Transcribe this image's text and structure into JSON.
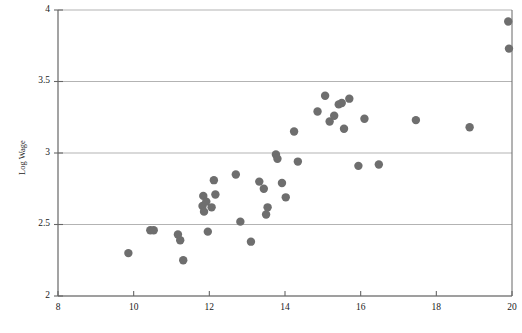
{
  "chart_data": {
    "type": "scatter",
    "title": "",
    "subtitle": "",
    "xlabel": "",
    "ylabel": "Log Wage",
    "xlim": [
      8,
      20
    ],
    "ylim": [
      2,
      4
    ],
    "xticks": [
      8,
      10,
      12,
      14,
      16,
      18,
      20
    ],
    "xticklabels": [
      "8",
      "10",
      "12",
      "14",
      "16",
      "18",
      "20"
    ],
    "yticks": [
      2,
      2.5,
      3,
      3.5,
      4
    ],
    "yticklabels": [
      "2",
      "2.5",
      "3",
      "3.5",
      "4"
    ],
    "grid": {
      "horizontal": true,
      "vertical": false,
      "color": "#b3b3b3"
    },
    "legend": {
      "visible": false,
      "position": "none"
    },
    "marker": {
      "shape": "circle",
      "color": "#6e6e6e",
      "size": 5.2
    },
    "axis_color": "#666666",
    "series": [
      {
        "name": "observations",
        "points": [
          [
            9.86,
            2.3
          ],
          [
            10.44,
            2.46
          ],
          [
            10.53,
            2.46
          ],
          [
            11.17,
            2.43
          ],
          [
            11.23,
            2.39
          ],
          [
            11.31,
            2.25
          ],
          [
            11.82,
            2.63
          ],
          [
            11.84,
            2.7
          ],
          [
            11.86,
            2.59
          ],
          [
            11.92,
            2.66
          ],
          [
            11.96,
            2.45
          ],
          [
            12.06,
            2.62
          ],
          [
            12.12,
            2.81
          ],
          [
            12.16,
            2.71
          ],
          [
            12.7,
            2.85
          ],
          [
            12.82,
            2.52
          ],
          [
            13.1,
            2.38
          ],
          [
            13.32,
            2.8
          ],
          [
            13.44,
            2.75
          ],
          [
            13.5,
            2.57
          ],
          [
            13.54,
            2.62
          ],
          [
            13.76,
            2.99
          ],
          [
            13.8,
            2.96
          ],
          [
            13.92,
            2.79
          ],
          [
            14.02,
            2.69
          ],
          [
            14.24,
            3.15
          ],
          [
            14.34,
            2.94
          ],
          [
            14.86,
            3.29
          ],
          [
            15.06,
            3.4
          ],
          [
            15.18,
            3.22
          ],
          [
            15.3,
            3.26
          ],
          [
            15.42,
            3.34
          ],
          [
            15.5,
            3.35
          ],
          [
            15.56,
            3.17
          ],
          [
            15.7,
            3.38
          ],
          [
            15.94,
            2.91
          ],
          [
            16.1,
            3.24
          ],
          [
            16.48,
            2.92
          ],
          [
            17.46,
            3.23
          ],
          [
            18.88,
            3.18
          ],
          [
            19.9,
            3.92
          ],
          [
            19.92,
            3.73
          ]
        ]
      }
    ]
  },
  "axes": {
    "y_axis_title": "Log Wage"
  }
}
